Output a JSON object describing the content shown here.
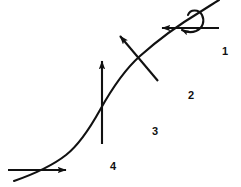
{
  "figure": {
    "width": 241,
    "height": 187,
    "background_color": "#ffffff",
    "stroke_color": "#111111"
  },
  "curve": {
    "name": "s-curve",
    "description": "Continuous S-shaped (sigmoid-like) curve running from lower-left to upper-right",
    "stroke_color": "#111111",
    "stroke_width": 2.1,
    "start_point": [
      14,
      181
    ],
    "end_point": [
      219,
      0
    ]
  },
  "vectors": [
    {
      "id": "bottom-horizontal",
      "label": "",
      "direction": "right",
      "type": "straight-arrow",
      "start_point": [
        8,
        170
      ],
      "end_point": [
        66,
        170
      ],
      "stroke_color": "#111111"
    },
    {
      "id": "lower-vertical",
      "label": "",
      "direction": "up",
      "type": "straight-arrow",
      "start_point": [
        102,
        144
      ],
      "end_point": [
        102,
        61
      ],
      "stroke_color": "#111111"
    },
    {
      "id": "middle-diagonal",
      "label": "",
      "direction": "up-left",
      "type": "straight-arrow",
      "start_point": [
        158,
        81
      ],
      "end_point": [
        120,
        36
      ],
      "stroke_color": "#111111"
    },
    {
      "id": "top-horizontal",
      "label": "",
      "direction": "left",
      "type": "straight-arrow",
      "start_point": [
        219,
        28
      ],
      "end_point": [
        162,
        28
      ],
      "stroke_color": "#111111"
    },
    {
      "id": "top-rotation",
      "label": "",
      "direction": "clockwise",
      "type": "curved-loop-arrow",
      "center_point": [
        196,
        22
      ],
      "stroke_color": "#111111"
    }
  ],
  "labels": [
    {
      "id": "region-1",
      "text": "1",
      "x": 224,
      "y": 52
    },
    {
      "id": "region-2",
      "text": "2",
      "x": 191,
      "y": 96
    },
    {
      "id": "region-3",
      "text": "3",
      "x": 155,
      "y": 132
    },
    {
      "id": "region-4",
      "text": "4",
      "x": 113,
      "y": 167
    }
  ]
}
